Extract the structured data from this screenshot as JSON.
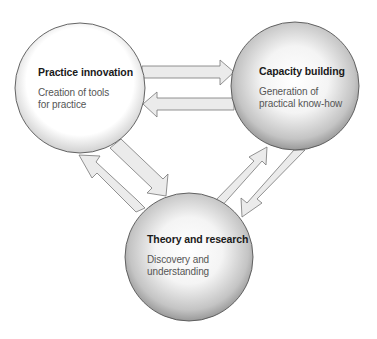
{
  "diagram": {
    "type": "cycle-diagram",
    "nodes": [
      {
        "id": "practice-innovation",
        "title": "Practice innovation",
        "desc_line1": "Creation of tools",
        "desc_line2": "for practice",
        "center": [
          80,
          88
        ],
        "radius": 65,
        "edge_color": "#c8c8c8"
      },
      {
        "id": "capacity-building",
        "title": "Capacity building",
        "desc_line1": "Generation of",
        "desc_line2": "practical know-how",
        "center": [
          295,
          86
        ],
        "radius": 64,
        "edge_color": "#8c8c8c"
      },
      {
        "id": "theory-research",
        "title": "Theory and research",
        "desc_line1": "Discovery and",
        "desc_line2": "understanding",
        "center": [
          189,
          257
        ],
        "radius": 64,
        "edge_color": "#8c8c8c"
      }
    ],
    "edges": [
      {
        "from": "Practice innovation",
        "to": "Capacity building"
      },
      {
        "from": "Capacity building",
        "to": "Practice innovation"
      },
      {
        "from": "Practice innovation",
        "to": "Theory and research"
      },
      {
        "from": "Theory and research",
        "to": "Practice innovation"
      },
      {
        "from": "Theory and research",
        "to": "Capacity building"
      },
      {
        "from": "Capacity building",
        "to": "Theory and research"
      }
    ],
    "colors": {
      "arrow_fill": "#ebebeb",
      "arrow_stroke": "#777777",
      "circle_stroke": "#555555",
      "title_text": "#1a1a1a",
      "desc_text": "#555555"
    }
  }
}
